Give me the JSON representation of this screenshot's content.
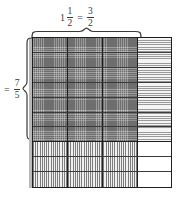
{
  "diagram": {
    "top_label": {
      "name": "width-label",
      "whole": "1",
      "mixed_numerator": "1",
      "mixed_denominator": "2",
      "equals": "=",
      "improper_numerator": "3",
      "improper_denominator": "2",
      "text": "1 1/2 = 3/2"
    },
    "left_label": {
      "name": "height-label",
      "equals": "=",
      "numerator": "7",
      "denominator": "5",
      "text": "= 7/5"
    },
    "grid": {
      "columns": 4,
      "rows": 10,
      "shaded_columns": 3,
      "shaded_rows": 7,
      "regions": [
        {
          "name": "double-shaded",
          "pattern": "cross-hatch-dots",
          "cols": 3,
          "rows": 7,
          "color": "#6e6e6e"
        },
        {
          "name": "horizontal-shaded",
          "pattern": "horizontal-stripes",
          "cols": 1,
          "rows": 7,
          "color": "#9a9a9a"
        },
        {
          "name": "vertical-shaded",
          "pattern": "vertical-stripes",
          "cols": 3,
          "rows": 3,
          "color": "#7d7d7d"
        },
        {
          "name": "unshaded",
          "pattern": "solid-white",
          "cols": 1,
          "rows": 3,
          "color": "#ffffff"
        }
      ],
      "column_boundaries_px": [
        0,
        35,
        70,
        105,
        138
      ],
      "row_boundaries_px": [
        0,
        15,
        30,
        45,
        60,
        74,
        89,
        104,
        119,
        134,
        149
      ],
      "border_color": "#1f1f1f"
    },
    "braces": {
      "top": {
        "name": "top-brace",
        "spans_columns": 3
      },
      "left": {
        "name": "left-brace",
        "spans_rows": 7
      }
    }
  }
}
